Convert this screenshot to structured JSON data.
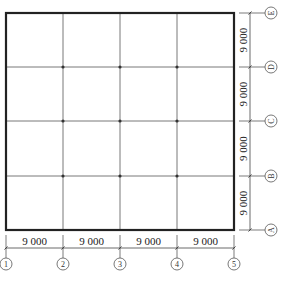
{
  "diagram": {
    "type": "structural-grid-plan",
    "columns": {
      "labels": [
        "①",
        "②",
        "③",
        "④",
        "⑤"
      ],
      "x": [
        6,
        63,
        120,
        177,
        234
      ],
      "spacings": [
        "9 000",
        "9 000",
        "9 000",
        "9 000"
      ]
    },
    "rows": {
      "labels": [
        "Ⓔ",
        "Ⓓ",
        "Ⓒ",
        "Ⓑ",
        "Ⓐ"
      ],
      "y": [
        13,
        67,
        121,
        176,
        230
      ],
      "spacings": [
        "9 000",
        "9 000",
        "9 000",
        "9 000"
      ]
    },
    "colors": {
      "outline": "#222222",
      "grid": "#6a6a6a",
      "node": "#333333",
      "dim": "#444444"
    }
  }
}
